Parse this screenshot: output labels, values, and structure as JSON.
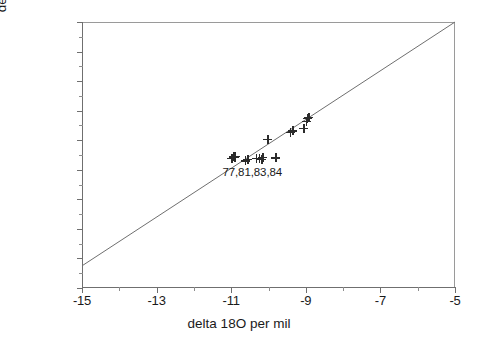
{
  "chart_data": {
    "type": "scatter",
    "title": "",
    "xlabel": "delta 18O  per mil",
    "ylabel": "delta 2H  per mil",
    "xlim": [
      -15,
      -5
    ],
    "ylim": [
      -120,
      -30
    ],
    "xticks": [
      -15,
      -13,
      -11,
      -9,
      -7,
      -5
    ],
    "xtick_labels": [
      "-15",
      "-13",
      "-11",
      "-9",
      "-7",
      "-5"
    ],
    "xticks_minor": [
      -14,
      -12,
      -10,
      -8,
      -6
    ],
    "yticks": [
      -120,
      -110,
      -100,
      -90,
      -80,
      -70,
      -60,
      -50,
      -40,
      -30
    ],
    "ytick_labels": [
      "-120",
      "-110",
      "-100",
      "-90",
      "-80",
      "-70",
      "-60",
      "-50",
      "-40",
      "-30"
    ],
    "grid": false,
    "legend": null,
    "marker": "plus",
    "marker_color": "#2b2b2b",
    "series": [
      {
        "name": "water samples",
        "x": [
          -10.98,
          -10.93,
          -10.9,
          -10.88,
          -10.62,
          -10.55,
          -10.33,
          -10.25,
          -10.18,
          -10.15,
          -10.02,
          -9.8,
          -9.42,
          -9.35,
          -9.05,
          -8.98,
          -8.95,
          -8.92
        ],
        "y": [
          -76.2,
          -75.6,
          -75.9,
          -75.4,
          -77.0,
          -76.4,
          -76.2,
          -76.1,
          -76.4,
          -75.8,
          -69.7,
          -76.0,
          -67.3,
          -66.8,
          -66.0,
          -63.6,
          -62.6,
          -62.3
        ]
      }
    ],
    "reference_line": {
      "name": "meteoric water line",
      "x": [
        -15,
        -5
      ],
      "y": [
        -112.5,
        -30
      ],
      "color": "#6f6f6f"
    },
    "annotations": [
      {
        "text": "77,81,83,84",
        "x": -10.35,
        "y": -81.0
      }
    ]
  },
  "figure": {
    "background": "#ffffff",
    "axis_color": "#6f6f6f",
    "text_color": "#1a1a1a"
  }
}
